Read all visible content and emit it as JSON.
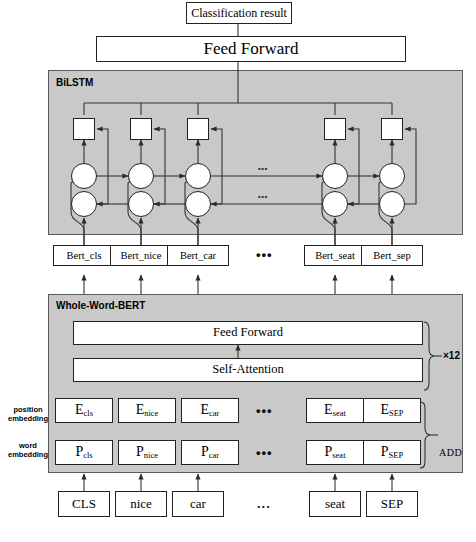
{
  "diagram": {
    "title_top": "Classification result",
    "feed_forward_top": "Feed Forward",
    "bilstm_panel_title": "BiLSTM",
    "bert_panel_title": "Whole-Word-BERT",
    "bert_feed_forward": "Feed Forward",
    "bert_self_attention": "Self-Attention",
    "encoder_repeat": "×12",
    "add_label": "ADD",
    "ellipsis": "•••",
    "ellipsis_small": "•••",
    "ellipsis_token": "...",
    "position_embedding_label_line1": "position",
    "position_embedding_label_line2": "embedding",
    "word_embedding_label_line1": "word",
    "word_embedding_label_line2": "embedding"
  },
  "columns": [
    {
      "index": 0,
      "bert_output": "Bert_cls",
      "position_embedding_base": "E",
      "position_embedding_sub": "cls",
      "word_embedding_base": "P",
      "word_embedding_sub": "cls",
      "token": "CLS"
    },
    {
      "index": 1,
      "bert_output": "Bert_nice",
      "position_embedding_base": "E",
      "position_embedding_sub": "nice",
      "word_embedding_base": "P",
      "word_embedding_sub": "nice",
      "token": "nice"
    },
    {
      "index": 2,
      "bert_output": "Bert_car",
      "position_embedding_base": "E",
      "position_embedding_sub": "car",
      "word_embedding_base": "P",
      "word_embedding_sub": "car",
      "token": "car"
    },
    {
      "index": 3,
      "bert_output": "Bert_seat",
      "position_embedding_base": "E",
      "position_embedding_sub": "seat",
      "word_embedding_base": "P",
      "word_embedding_sub": "seat",
      "token": "seat"
    },
    {
      "index": 4,
      "bert_output": "Bert_sep",
      "position_embedding_base": "E",
      "position_embedding_sub": "SEP",
      "word_embedding_base": "P",
      "word_embedding_sub": "SEP",
      "token": "SEP"
    }
  ],
  "colors": {
    "panel_fill": "#c9c9c9",
    "panel_stroke": "#5a5a5a",
    "node_fill": "#ffffff",
    "node_stroke": "#222222",
    "line": "#333333",
    "text": "#000000"
  }
}
